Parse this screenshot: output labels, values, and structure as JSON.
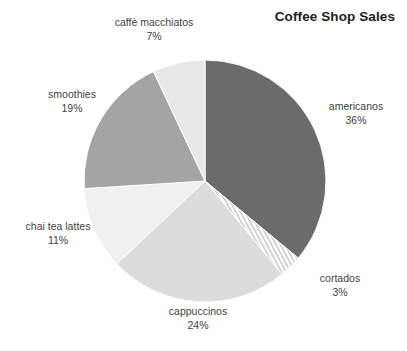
{
  "chart_data": {
    "type": "pie",
    "title": "Coffee Shop Sales",
    "xlabel": "",
    "ylabel": "",
    "legend_position": "none",
    "grid": false,
    "categories": [
      "americanos",
      "cortados",
      "cappuccinos",
      "chai tea lattes",
      "smoothies",
      "caffè macchiatos"
    ],
    "values": [
      36,
      3,
      24,
      11,
      19,
      7
    ],
    "unit": "%",
    "start_angle_deg": 0,
    "direction": "clockwise",
    "slices": [
      {
        "label": "americanos",
        "value": 36,
        "value_text": "36%",
        "color": "#6b6b6b",
        "pattern": "solid"
      },
      {
        "label": "cortados",
        "value": 3,
        "value_text": "3%",
        "color": "#f2f2f2",
        "pattern": "diagonal-stripes"
      },
      {
        "label": "cappuccinos",
        "value": 24,
        "value_text": "24%",
        "color": "#dcdcdc",
        "pattern": "solid"
      },
      {
        "label": "chai tea lattes",
        "value": 11,
        "value_text": "11%",
        "color": "#f0f0f0",
        "pattern": "solid"
      },
      {
        "label": "smoothies",
        "value": 19,
        "value_text": "19%",
        "color": "#a4a4a4",
        "pattern": "solid"
      },
      {
        "label": "caffè macchiatos",
        "value": 7,
        "value_text": "7%",
        "color": "#e8e8e8",
        "pattern": "solid"
      }
    ]
  },
  "title": "Coffee Shop Sales",
  "labels": {
    "americanos": {
      "name": "americanos",
      "value": "36%"
    },
    "cortados": {
      "name": "cortados",
      "value": "3%"
    },
    "cappuccinos": {
      "name": "cappuccinos",
      "value": "24%"
    },
    "chai": {
      "name": "chai tea lattes",
      "value": "11%"
    },
    "smoothies": {
      "name": "smoothies",
      "value": "19%"
    },
    "macchiatos": {
      "name": "caffè macchiatos",
      "value": "7%"
    }
  },
  "colors": {
    "background": "#ffffff",
    "title_color": "#1d1d1d",
    "label_color": "#3f3f3f",
    "slice_separator": "#ffffff"
  }
}
